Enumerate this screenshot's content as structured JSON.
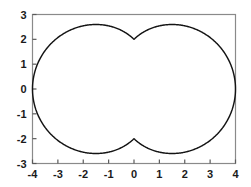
{
  "chart_data": {
    "type": "line",
    "title": "",
    "subtitle": "",
    "xlabel": "",
    "ylabel": "",
    "xlim": [
      -4,
      4
    ],
    "ylim": [
      -3,
      3
    ],
    "grid": false,
    "legend": false,
    "legend_position": "none",
    "curve_color": "#141414",
    "frame_color": "#8a8a8a",
    "background_color": "#ffffff",
    "x_ticks": [
      -4,
      -3,
      -2,
      -1,
      0,
      1,
      2,
      3,
      4
    ],
    "x_tick_labels": [
      "-4",
      "-3",
      "-2",
      "-1",
      "0",
      "1",
      "2",
      "3",
      "4"
    ],
    "y_ticks": [
      -3,
      -2,
      -1,
      0,
      1,
      2,
      3
    ],
    "y_tick_labels": [
      "-3",
      "-2",
      "-1",
      "0",
      "1",
      "2",
      "3"
    ],
    "extremes": {
      "x_min": -4,
      "x_max": 4,
      "y_min": -2.83,
      "y_max": 2.83,
      "cusp_top": [
        0,
        2
      ],
      "cusp_bottom": [
        0,
        -2
      ],
      "peak_left": [
        -1.41,
        2.83
      ],
      "peak_right": [
        1.41,
        2.83
      ]
    },
    "series": [
      {
        "name": "r = 2(1 + |cos θ|)",
        "x": [
          4.0,
          3.98,
          3.92,
          3.83,
          3.69,
          3.52,
          3.32,
          3.09,
          2.83,
          2.56,
          2.27,
          1.98,
          1.69,
          1.41,
          1.14,
          0.89,
          0.66,
          0.46,
          0.29,
          0.15,
          0.06,
          0.0,
          0.0,
          -0.06,
          -0.15,
          -0.29,
          -0.46,
          -0.66,
          -0.89,
          -1.14,
          -1.41,
          -1.69,
          -1.98,
          -2.27,
          -2.56,
          -2.83,
          -3.09,
          -3.32,
          -3.52,
          -3.69,
          -3.83,
          -3.92,
          -3.98,
          -4.0,
          -3.98,
          -3.92,
          -3.83,
          -3.69,
          -3.52,
          -3.32,
          -3.09,
          -2.83,
          -2.56,
          -2.27,
          -1.98,
          -1.69,
          -1.41,
          -1.14,
          -0.89,
          -0.66,
          -0.46,
          -0.29,
          -0.15,
          -0.06,
          0.0,
          0.0,
          0.06,
          0.15,
          0.29,
          0.46,
          0.66,
          0.89,
          1.14,
          1.41,
          1.69,
          1.98,
          2.27,
          2.56,
          2.83,
          3.09,
          3.32,
          3.52,
          3.69,
          3.83,
          3.92,
          3.98,
          4.0
        ],
        "y": [
          0.0,
          0.35,
          0.69,
          1.02,
          1.33,
          1.62,
          1.88,
          2.11,
          2.31,
          2.48,
          2.61,
          2.71,
          2.78,
          2.82,
          2.82,
          2.79,
          2.73,
          2.64,
          2.52,
          2.38,
          2.2,
          2.1,
          2.1,
          2.2,
          2.38,
          2.52,
          2.64,
          2.73,
          2.79,
          2.82,
          2.82,
          2.78,
          2.71,
          2.61,
          2.48,
          2.31,
          2.11,
          1.88,
          1.62,
          1.33,
          1.02,
          0.69,
          0.35,
          0.0,
          -0.35,
          -0.69,
          -1.02,
          -1.33,
          -1.62,
          -1.88,
          -2.11,
          -2.31,
          -2.48,
          -2.61,
          -2.71,
          -2.78,
          -2.82,
          -2.82,
          -2.79,
          -2.73,
          -2.64,
          -2.52,
          -2.38,
          -2.2,
          -2.1,
          -2.1,
          -2.2,
          -2.38,
          -2.52,
          -2.64,
          -2.73,
          -2.79,
          -2.82,
          -2.82,
          -2.78,
          -2.71,
          -2.61,
          -2.48,
          -2.31,
          -2.11,
          -1.88,
          -1.62,
          -1.33,
          -1.02,
          -0.69,
          -0.35,
          0.0
        ]
      }
    ]
  }
}
